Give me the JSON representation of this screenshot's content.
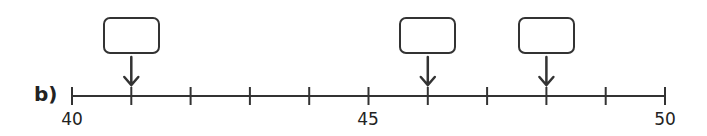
{
  "question_label": "b)",
  "number_line": {
    "start": 40,
    "end": 50,
    "step": 1,
    "labeled_ticks": [
      {
        "value": 40,
        "text": "40"
      },
      {
        "value": 45,
        "text": "45"
      },
      {
        "value": 50,
        "text": "50"
      }
    ],
    "arrow_targets": [
      41,
      46,
      48
    ]
  },
  "answer_boxes": [
    {
      "points_to": 41,
      "value": ""
    },
    {
      "points_to": 46,
      "value": ""
    },
    {
      "points_to": 48,
      "value": ""
    }
  ],
  "colors": {
    "line": "#333333",
    "text": "#222222"
  }
}
